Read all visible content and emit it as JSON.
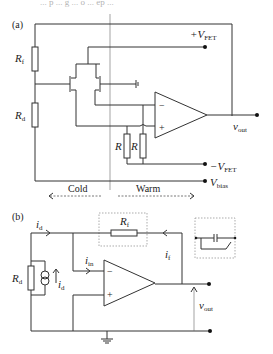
{
  "caption_fragment": "... p ... g ... o ... ep ...",
  "panel_a": {
    "label": "(a)",
    "labels": {
      "Rf": {
        "main": "R",
        "sub": "f"
      },
      "Rd": {
        "main": "R",
        "sub": "d"
      },
      "R1": "R",
      "R2": "R",
      "vfet_pos": {
        "main": "+V",
        "sub": "FET"
      },
      "vfet_neg": {
        "main": "−V",
        "sub": "FET"
      },
      "vbias": {
        "main": "V",
        "sub": "bias"
      },
      "vout": {
        "main": "v",
        "sub": "out"
      },
      "opamp_minus": "−",
      "opamp_plus": "+"
    },
    "regions": {
      "cold": "Cold",
      "warm": "Warm"
    }
  },
  "panel_b": {
    "label": "(b)",
    "labels": {
      "id_top": {
        "main": "i",
        "sub": "d"
      },
      "id_src": {
        "main": "i",
        "sub": "d"
      },
      "iin": {
        "main": "i",
        "sub": "in"
      },
      "if": {
        "main": "i",
        "sub": "f"
      },
      "Rf": {
        "main": "R",
        "sub": "f"
      },
      "Rd": {
        "main": "R",
        "sub": "d"
      },
      "vout": {
        "main": "v",
        "sub": "out"
      },
      "opamp_minus": "−",
      "opamp_plus": "+"
    }
  }
}
